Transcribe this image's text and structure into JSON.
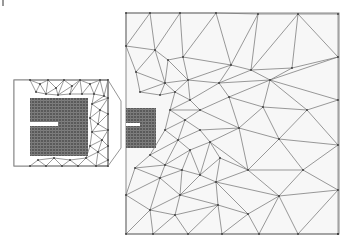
{
  "figure": {
    "type": "triangular finite-element mesh with magnified inset",
    "width": 353,
    "height": 246,
    "colors": {
      "background": "#ffffff",
      "domain_fill": "#f7f7f7",
      "mesh_line": "#6e6e6e",
      "frame": "#8a8a8a",
      "dense_region": "#5a5a5a",
      "node": "#3a3a3a"
    }
  },
  "main_domain": {
    "x": 126,
    "y": 13,
    "width": 213,
    "height": 221,
    "dense_patch": {
      "x": 126,
      "y": 108,
      "width": 30,
      "height": 40
    },
    "slit": {
      "x": 126,
      "y": 123,
      "width": 14,
      "height": 3
    },
    "nodes": [
      [
        126,
        13
      ],
      [
        150,
        13
      ],
      [
        180,
        13
      ],
      [
        216,
        13
      ],
      [
        258,
        14
      ],
      [
        298,
        14
      ],
      [
        338,
        14
      ],
      [
        126,
        46
      ],
      [
        155,
        50
      ],
      [
        168,
        60
      ],
      [
        183,
        57
      ],
      [
        231,
        65
      ],
      [
        251,
        70
      ],
      [
        292,
        68
      ],
      [
        338,
        57
      ],
      [
        136,
        72
      ],
      [
        165,
        83
      ],
      [
        188,
        80
      ],
      [
        219,
        83
      ],
      [
        270,
        80
      ],
      [
        307,
        110
      ],
      [
        140,
        92
      ],
      [
        160,
        95
      ],
      [
        175,
        92
      ],
      [
        190,
        100
      ],
      [
        200,
        110
      ],
      [
        229,
        97
      ],
      [
        263,
        107
      ],
      [
        170,
        110
      ],
      [
        185,
        120
      ],
      [
        200,
        130
      ],
      [
        239,
        128
      ],
      [
        279,
        139
      ],
      [
        338,
        145
      ],
      [
        165,
        130
      ],
      [
        178,
        140
      ],
      [
        190,
        150
      ],
      [
        210,
        142
      ],
      [
        248,
        170
      ],
      [
        303,
        170
      ],
      [
        150,
        155
      ],
      [
        165,
        165
      ],
      [
        182,
        170
      ],
      [
        200,
        175
      ],
      [
        220,
        158
      ],
      [
        135,
        168
      ],
      [
        160,
        178
      ],
      [
        180,
        195
      ],
      [
        216,
        182
      ],
      [
        279,
        196
      ],
      [
        338,
        190
      ],
      [
        126,
        195
      ],
      [
        150,
        210
      ],
      [
        175,
        215
      ],
      [
        218,
        205
      ],
      [
        248,
        214
      ],
      [
        126,
        234
      ],
      [
        153,
        234
      ],
      [
        188,
        234
      ],
      [
        222,
        234
      ],
      [
        259,
        234
      ],
      [
        298,
        234
      ],
      [
        338,
        234
      ],
      [
        338,
        100
      ],
      [
        338,
        234
      ]
    ],
    "edges": [
      [
        0,
        7
      ],
      [
        0,
        1
      ],
      [
        1,
        7
      ],
      [
        1,
        8
      ],
      [
        1,
        2
      ],
      [
        2,
        8
      ],
      [
        2,
        10
      ],
      [
        2,
        3
      ],
      [
        3,
        10
      ],
      [
        3,
        11
      ],
      [
        3,
        4
      ],
      [
        4,
        11
      ],
      [
        4,
        12
      ],
      [
        4,
        5
      ],
      [
        5,
        12
      ],
      [
        5,
        13
      ],
      [
        5,
        6
      ],
      [
        6,
        14
      ],
      [
        5,
        14
      ],
      [
        7,
        8
      ],
      [
        7,
        15
      ],
      [
        8,
        15
      ],
      [
        8,
        9
      ],
      [
        9,
        10
      ],
      [
        9,
        16
      ],
      [
        8,
        16
      ],
      [
        10,
        17
      ],
      [
        9,
        17
      ],
      [
        10,
        11
      ],
      [
        11,
        17
      ],
      [
        11,
        18
      ],
      [
        11,
        12
      ],
      [
        12,
        18
      ],
      [
        12,
        19
      ],
      [
        12,
        13
      ],
      [
        13,
        19
      ],
      [
        13,
        14
      ],
      [
        14,
        19
      ],
      [
        14,
        63
      ],
      [
        19,
        63
      ],
      [
        19,
        20
      ],
      [
        20,
        63
      ],
      [
        15,
        16
      ],
      [
        15,
        21
      ],
      [
        16,
        21
      ],
      [
        16,
        22
      ],
      [
        16,
        17
      ],
      [
        17,
        23
      ],
      [
        16,
        23
      ],
      [
        17,
        18
      ],
      [
        18,
        24
      ],
      [
        17,
        24
      ],
      [
        18,
        26
      ],
      [
        18,
        19
      ],
      [
        19,
        26
      ],
      [
        19,
        27
      ],
      [
        20,
        27
      ],
      [
        20,
        32
      ],
      [
        27,
        32
      ],
      [
        21,
        22
      ],
      [
        22,
        23
      ],
      [
        23,
        24
      ],
      [
        24,
        25
      ],
      [
        25,
        26
      ],
      [
        26,
        27
      ],
      [
        24,
        28
      ],
      [
        23,
        28
      ],
      [
        25,
        28
      ],
      [
        25,
        29
      ],
      [
        28,
        29
      ],
      [
        26,
        31
      ],
      [
        25,
        31
      ],
      [
        27,
        31
      ],
      [
        31,
        32
      ],
      [
        32,
        33
      ],
      [
        63,
        33
      ],
      [
        20,
        33
      ],
      [
        29,
        30
      ],
      [
        28,
        34
      ],
      [
        29,
        34
      ],
      [
        34,
        35
      ],
      [
        29,
        35
      ],
      [
        30,
        35
      ],
      [
        30,
        31
      ],
      [
        30,
        37
      ],
      [
        31,
        37
      ],
      [
        31,
        38
      ],
      [
        32,
        38
      ],
      [
        32,
        39
      ],
      [
        33,
        39
      ],
      [
        37,
        38
      ],
      [
        38,
        39
      ],
      [
        35,
        36
      ],
      [
        36,
        37
      ],
      [
        34,
        40
      ],
      [
        35,
        40
      ],
      [
        40,
        41
      ],
      [
        35,
        41
      ],
      [
        36,
        41
      ],
      [
        36,
        42
      ],
      [
        41,
        42
      ],
      [
        36,
        43
      ],
      [
        37,
        43
      ],
      [
        42,
        43
      ],
      [
        43,
        44
      ],
      [
        37,
        44
      ],
      [
        44,
        38
      ],
      [
        44,
        48
      ],
      [
        38,
        48
      ],
      [
        38,
        49
      ],
      [
        39,
        49
      ],
      [
        39,
        50
      ],
      [
        33,
        50
      ],
      [
        49,
        50
      ],
      [
        40,
        45
      ],
      [
        41,
        45
      ],
      [
        45,
        46
      ],
      [
        41,
        46
      ],
      [
        46,
        47
      ],
      [
        42,
        47
      ],
      [
        42,
        46
      ],
      [
        43,
        47
      ],
      [
        47,
        48
      ],
      [
        43,
        48
      ],
      [
        48,
        49
      ],
      [
        45,
        51
      ],
      [
        46,
        51
      ],
      [
        51,
        52
      ],
      [
        46,
        52
      ],
      [
        47,
        52
      ],
      [
        52,
        53
      ],
      [
        47,
        53
      ],
      [
        53,
        54
      ],
      [
        47,
        54
      ],
      [
        48,
        54
      ],
      [
        54,
        55
      ],
      [
        48,
        55
      ],
      [
        49,
        55
      ],
      [
        55,
        60
      ],
      [
        49,
        60
      ],
      [
        49,
        61
      ],
      [
        50,
        61
      ],
      [
        50,
        62
      ],
      [
        51,
        56
      ],
      [
        52,
        56
      ],
      [
        52,
        57
      ],
      [
        56,
        57
      ],
      [
        53,
        57
      ],
      [
        53,
        58
      ],
      [
        57,
        58
      ],
      [
        54,
        58
      ],
      [
        54,
        59
      ],
      [
        58,
        59
      ],
      [
        55,
        59
      ],
      [
        59,
        60
      ],
      [
        60,
        61
      ],
      [
        61,
        62
      ]
    ]
  },
  "inset": {
    "x": 14,
    "y": 80,
    "width": 94,
    "height": 86,
    "blank_strip": {
      "x": 14,
      "y": 80,
      "width": 16,
      "height": 86
    },
    "dense_patch": {
      "x": 30,
      "y": 98,
      "width": 58,
      "height": 58
    },
    "slit": {
      "x": 14,
      "y": 122,
      "width": 44,
      "height": 4
    },
    "nodes": [
      [
        30,
        80
      ],
      [
        40,
        84
      ],
      [
        48,
        80
      ],
      [
        56,
        88
      ],
      [
        64,
        80
      ],
      [
        72,
        86
      ],
      [
        80,
        80
      ],
      [
        90,
        84
      ],
      [
        100,
        80
      ],
      [
        108,
        80
      ],
      [
        36,
        92
      ],
      [
        46,
        94
      ],
      [
        58,
        95
      ],
      [
        70,
        94
      ],
      [
        82,
        94
      ],
      [
        94,
        94
      ],
      [
        104,
        96
      ],
      [
        108,
        98
      ],
      [
        92,
        104
      ],
      [
        100,
        110
      ],
      [
        108,
        114
      ],
      [
        90,
        118
      ],
      [
        98,
        124
      ],
      [
        108,
        130
      ],
      [
        92,
        132
      ],
      [
        102,
        140
      ],
      [
        108,
        146
      ],
      [
        90,
        146
      ],
      [
        98,
        152
      ],
      [
        108,
        160
      ],
      [
        30,
        166
      ],
      [
        38,
        160
      ],
      [
        46,
        166
      ],
      [
        54,
        158
      ],
      [
        62,
        166
      ],
      [
        70,
        160
      ],
      [
        78,
        166
      ],
      [
        86,
        158
      ],
      [
        96,
        166
      ],
      [
        108,
        166
      ]
    ],
    "edges": [
      [
        0,
        1
      ],
      [
        1,
        2
      ],
      [
        2,
        3
      ],
      [
        3,
        4
      ],
      [
        4,
        5
      ],
      [
        5,
        6
      ],
      [
        6,
        7
      ],
      [
        7,
        8
      ],
      [
        8,
        9
      ],
      [
        1,
        10
      ],
      [
        0,
        10
      ],
      [
        1,
        11
      ],
      [
        10,
        11
      ],
      [
        2,
        11
      ],
      [
        3,
        11
      ],
      [
        3,
        12
      ],
      [
        11,
        12
      ],
      [
        4,
        12
      ],
      [
        5,
        12
      ],
      [
        5,
        13
      ],
      [
        12,
        13
      ],
      [
        6,
        13
      ],
      [
        6,
        14
      ],
      [
        13,
        14
      ],
      [
        7,
        14
      ],
      [
        7,
        15
      ],
      [
        14,
        15
      ],
      [
        8,
        15
      ],
      [
        8,
        16
      ],
      [
        15,
        16
      ],
      [
        9,
        16
      ],
      [
        9,
        17
      ],
      [
        16,
        17
      ],
      [
        15,
        18
      ],
      [
        16,
        18
      ],
      [
        17,
        18
      ],
      [
        18,
        19
      ],
      [
        17,
        19
      ],
      [
        19,
        20
      ],
      [
        17,
        20
      ],
      [
        18,
        21
      ],
      [
        19,
        21
      ],
      [
        21,
        22
      ],
      [
        19,
        22
      ],
      [
        20,
        22
      ],
      [
        22,
        23
      ],
      [
        20,
        23
      ],
      [
        21,
        24
      ],
      [
        22,
        24
      ],
      [
        23,
        24
      ],
      [
        24,
        25
      ],
      [
        23,
        25
      ],
      [
        25,
        26
      ],
      [
        23,
        26
      ],
      [
        24,
        27
      ],
      [
        25,
        27
      ],
      [
        27,
        28
      ],
      [
        25,
        28
      ],
      [
        26,
        28
      ],
      [
        28,
        29
      ],
      [
        26,
        29
      ],
      [
        30,
        31
      ],
      [
        31,
        32
      ],
      [
        32,
        33
      ],
      [
        33,
        34
      ],
      [
        34,
        35
      ],
      [
        35,
        36
      ],
      [
        36,
        37
      ],
      [
        37,
        38
      ],
      [
        38,
        39
      ],
      [
        31,
        33
      ],
      [
        33,
        35
      ],
      [
        35,
        37
      ],
      [
        37,
        28
      ],
      [
        28,
        38
      ],
      [
        29,
        38
      ],
      [
        29,
        39
      ],
      [
        27,
        37
      ]
    ]
  },
  "connector": {
    "inset_top_right": [
      108,
      80
    ],
    "inset_bottom_right": [
      108,
      166
    ],
    "target_top": [
      121,
      101
    ],
    "target_bottom": [
      121,
      148
    ],
    "target_box": {
      "x": 121,
      "y": 101,
      "width": 5,
      "height": 47
    }
  },
  "corner_mark": {
    "x": 3,
    "y1": 0,
    "y2": 6
  }
}
